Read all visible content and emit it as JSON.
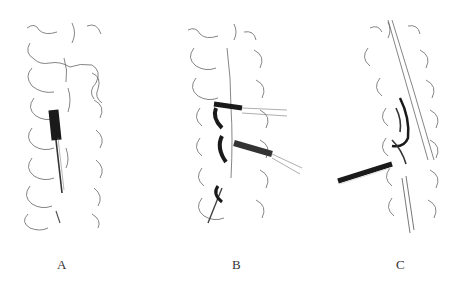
{
  "figure": {
    "panels": [
      {
        "id": "A",
        "label": "A",
        "description": "Posterior view of spine with single dark cylindrical instrument placed along midline"
      },
      {
        "id": "B",
        "label": "B",
        "description": "Posterior view of spine with two angled tubular instruments inserted laterally"
      },
      {
        "id": "C",
        "label": "C",
        "description": "Oblique view of spine with angled instrument inserted from lower left"
      }
    ],
    "colors": {
      "line": "#555555",
      "dark_fill": "#1a1a1a",
      "background": "#ffffff"
    }
  }
}
